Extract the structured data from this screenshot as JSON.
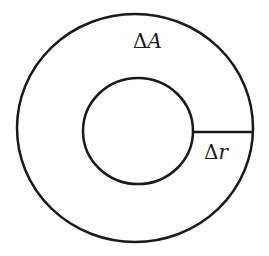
{
  "diagram": {
    "labels": {
      "area": {
        "delta": "Δ",
        "var": "A"
      },
      "radius": {
        "delta": "Δ",
        "var": "r"
      }
    },
    "shapes": {
      "outer_circle": {
        "cx": 135,
        "cy": 128,
        "rx": 118,
        "ry": 114
      },
      "inner_circle": {
        "cx": 138,
        "cy": 131,
        "rx": 55,
        "ry": 53
      },
      "radial_segment": {
        "x1": 193,
        "y1": 132,
        "x2": 252,
        "y2": 132
      }
    },
    "colors": {
      "stroke": "#1a1a1a",
      "background": "#ffffff"
    }
  }
}
